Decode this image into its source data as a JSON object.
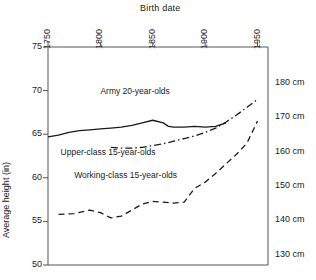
{
  "chart_data": {
    "type": "line",
    "title": "",
    "xlabel": "Birth date",
    "ylabel": "Average height (in)",
    "y2label": "",
    "xlim": [
      1750,
      1960
    ],
    "ylim": [
      50,
      75
    ],
    "y2lim_cm": [
      127,
      190.5
    ],
    "grid": false,
    "legend_position": "inline-annotations",
    "x_ticks": [
      "1750",
      "1800",
      "1850",
      "1900",
      "1950"
    ],
    "x_tick_values": [
      1750,
      1800,
      1850,
      1900,
      1950
    ],
    "y_ticks": [
      "75",
      "70",
      "65",
      "60",
      "55",
      "50"
    ],
    "y_tick_values": [
      75,
      70,
      65,
      60,
      55,
      50
    ],
    "y2_ticks": [
      "180 cm",
      "170 cm",
      "160 cm",
      "150 cm",
      "140 cm",
      "130 cm"
    ],
    "y2_tick_values": [
      180,
      170,
      160,
      150,
      140,
      130
    ],
    "series": [
      {
        "name": "Army 20-year-olds",
        "style": "solid",
        "color": "#1a1a1a",
        "label_x": 1800,
        "label_y": 69.8,
        "x": [
          1750,
          1760,
          1770,
          1780,
          1790,
          1800,
          1810,
          1820,
          1830,
          1840,
          1850,
          1860,
          1865,
          1870,
          1880,
          1890,
          1900,
          1910,
          1920
        ],
        "y": [
          64.7,
          64.9,
          65.2,
          65.4,
          65.5,
          65.6,
          65.7,
          65.8,
          66.0,
          66.3,
          66.6,
          66.3,
          65.9,
          65.8,
          65.8,
          65.9,
          65.8,
          65.9,
          66.3
        ]
      },
      {
        "name": "Upper-class 15-year-olds",
        "style": "dashdot",
        "color": "#1a1a1a",
        "label_x": 1762,
        "label_y": 62.9,
        "x": [
          1810,
          1820,
          1830,
          1840,
          1850,
          1860,
          1870,
          1880,
          1890,
          1900,
          1910,
          1920,
          1930,
          1940,
          1950
        ],
        "y": [
          63.5,
          63.4,
          63.4,
          63.5,
          63.7,
          63.9,
          64.2,
          64.5,
          64.8,
          65.2,
          65.7,
          66.4,
          67.2,
          68.1,
          69.0
        ]
      },
      {
        "name": "Working-class 15-year-olds",
        "style": "dashed",
        "color": "#1a1a1a",
        "label_x": 1775,
        "label_y": 60.2,
        "x": [
          1760,
          1775,
          1790,
          1800,
          1810,
          1820,
          1830,
          1840,
          1850,
          1860,
          1870,
          1880,
          1890,
          1900,
          1910,
          1920,
          1930,
          1940,
          1950
        ],
        "y": [
          55.8,
          55.9,
          56.3,
          56.0,
          55.4,
          55.6,
          56.3,
          57.0,
          57.3,
          57.2,
          57.1,
          57.2,
          58.8,
          59.5,
          60.5,
          61.6,
          62.7,
          64.0,
          66.5
        ]
      }
    ]
  }
}
